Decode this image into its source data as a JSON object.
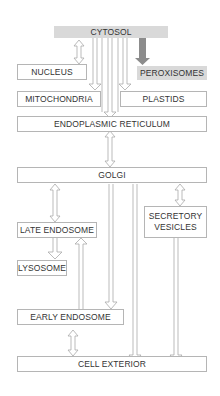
{
  "diagram": {
    "nodes": {
      "cytosol": "CYTOSOL",
      "nucleus": "NUCLEUS",
      "peroxisomes": "PEROXISOMES",
      "mitochondria": "MITOCHONDRIA",
      "plastids": "PLASTIDS",
      "er": "ENDOPLASMIC RETICULUM",
      "golgi": "GOLGI",
      "late_endosome": "LATE ENDOSOME",
      "secretory_vesicles_1": "SECRETORY",
      "secretory_vesicles_2": "VESICLES",
      "lysosome": "LYSOSOME",
      "early_endosome": "EARLY ENDOSOME",
      "cell_exterior": "CELL EXTERIOR"
    },
    "colors": {
      "highlight_fill": "#d9d9d9",
      "arrow_stroke": "#aaaaaa",
      "peroxisome_arrow": "#8c8c8c",
      "box_border": "#b5b5b5"
    }
  }
}
